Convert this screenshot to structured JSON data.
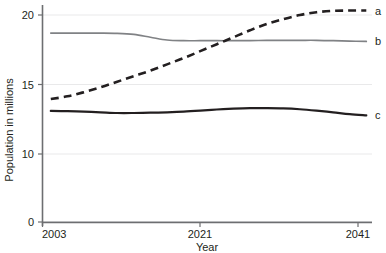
{
  "chart_data": {
    "type": "line",
    "title": "",
    "subtitle": "",
    "xlabel": "Year",
    "ylabel": "Population in millions",
    "xlim": [
      2003,
      2043
    ],
    "ylim": [
      0,
      21
    ],
    "grid": true,
    "grid_axis": "y",
    "legend_position": "right-of-plot-endpoint",
    "x_ticks": [
      2003,
      2021,
      2041
    ],
    "x_tick_labels": [
      "2003",
      "2021",
      "2041"
    ],
    "y_ticks": [
      0,
      10,
      15,
      20
    ],
    "y_tick_labels": [
      "0",
      "10",
      "15",
      "20"
    ],
    "axis_note": "y-axis is broken between 0 and 10",
    "x": [
      2004,
      2006,
      2008,
      2010,
      2012,
      2014,
      2016,
      2018,
      2020,
      2022,
      2024,
      2026,
      2028,
      2030,
      2032,
      2034,
      2036,
      2038,
      2040,
      2042
    ],
    "series": [
      {
        "name": "a",
        "label": "a",
        "style": "dashed",
        "color": "#231f20",
        "values": [
          13.95,
          14.15,
          14.45,
          14.8,
          15.2,
          15.6,
          16.0,
          16.45,
          16.9,
          17.4,
          17.9,
          18.4,
          18.9,
          19.35,
          19.7,
          20.0,
          20.2,
          20.3,
          20.32,
          20.32
        ]
      },
      {
        "name": "b",
        "label": "b",
        "style": "solid",
        "color": "#808285",
        "values": [
          18.7,
          18.7,
          18.7,
          18.7,
          18.68,
          18.6,
          18.4,
          18.2,
          18.15,
          18.15,
          18.15,
          18.15,
          18.16,
          18.17,
          18.18,
          18.18,
          18.18,
          18.15,
          18.12,
          18.1
        ]
      },
      {
        "name": "c",
        "label": "c",
        "style": "solid-bold",
        "color": "#231f20",
        "values": [
          13.1,
          13.08,
          13.05,
          13.0,
          12.95,
          12.95,
          12.97,
          13.0,
          13.05,
          13.12,
          13.2,
          13.26,
          13.3,
          13.3,
          13.28,
          13.22,
          13.12,
          13.0,
          12.87,
          12.78
        ]
      }
    ]
  },
  "axis": {
    "x_title": "Year",
    "y_title": "Population in millions"
  },
  "colors": {
    "axis": "#6d6e71",
    "grid": "#e9e9ea",
    "series_a": "#231f20",
    "series_b": "#808285",
    "series_c": "#231f20",
    "text": "#231f20"
  }
}
